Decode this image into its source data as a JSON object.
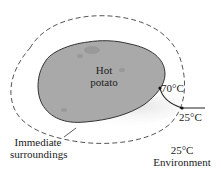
{
  "diagram": {
    "object_label_line1": "Hot",
    "object_label_line2": "potato",
    "surface_temp": "70°C",
    "boundary_temp": "25°C",
    "surroundings_label_line1": "Immediate",
    "surroundings_label_line2": "surroundings",
    "environment_temp": "25°C",
    "environment_label": "Environment",
    "colors": {
      "potato_fill": "#a9a9a9",
      "potato_outline": "#333333",
      "dashed_boundary": "#555555",
      "shadow": "#e6e6e6"
    }
  }
}
